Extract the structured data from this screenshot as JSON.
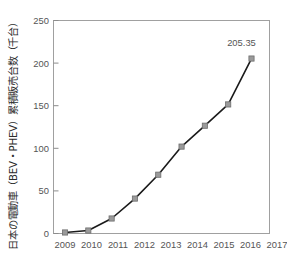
{
  "chart_data": {
    "type": "line",
    "title": "",
    "subtitle": "",
    "xlabel": "",
    "ylabel": "日本の電動車（BEV・PHEV）累積販売台数（千台）",
    "categories": [
      "2009",
      "2010",
      "2011",
      "2012",
      "2013",
      "2014",
      "2015",
      "2016",
      "2017"
    ],
    "x": [
      2009,
      2010,
      2011,
      2012,
      2013,
      2014,
      2015,
      2016,
      2017
    ],
    "values": [
      1.2,
      3.5,
      17.6,
      41.0,
      69.0,
      102.0,
      126.5,
      151.5,
      205.35
    ],
    "series": [
      {
        "name": "日本の電動車（BEV・PHEV）累積販売台数",
        "values": [
          1.2,
          3.5,
          17.6,
          41.0,
          69.0,
          102.0,
          126.5,
          151.5,
          205.35
        ]
      }
    ],
    "ylim": [
      0,
      250
    ],
    "yticks": [
      0,
      50,
      100,
      150,
      200,
      250
    ],
    "ytick_labels": [
      "0",
      "50",
      "100",
      "150",
      "200",
      "250"
    ],
    "xtick_labels": [
      "2009",
      "2010",
      "2011",
      "2012",
      "2013",
      "2014",
      "2015",
      "2016",
      "2017"
    ],
    "grid": false,
    "legend": false,
    "legend_position": "none",
    "annotations": [
      {
        "label": "205.35",
        "x": 2017,
        "y": 205.35
      }
    ],
    "colors": {
      "line": "#1a1a1a",
      "marker_fill": "#9a9a9a",
      "marker_edge": "#6e6e6e",
      "axis": "#8c8c8c",
      "tick_text": "#555555",
      "axis_title": "#2b2b2b",
      "background": "#ffffff"
    }
  },
  "axes": {
    "y_title": "日本の電動車（BEV・PHEV）累積販売台数（千台）",
    "y_ticks": [
      "0",
      "50",
      "100",
      "150",
      "200",
      "250"
    ],
    "x_ticks": [
      "2009",
      "2010",
      "2011",
      "2012",
      "2013",
      "2014",
      "2015",
      "2016",
      "2017"
    ]
  },
  "annotation_label": "205.35"
}
